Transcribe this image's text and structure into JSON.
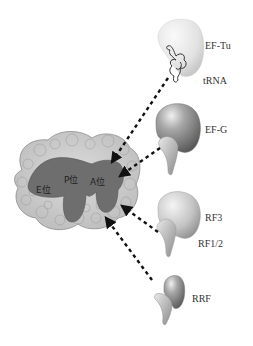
{
  "diagram": {
    "type": "ribosome-translation-factors",
    "ribosome": {
      "name": "ribosome",
      "sites": [
        {
          "id": "E",
          "label": "E位"
        },
        {
          "id": "P",
          "label": "P位"
        },
        {
          "id": "A",
          "label": "A位"
        }
      ]
    },
    "factors": [
      {
        "id": "ef-tu",
        "label": "EF-Tu",
        "sub_label": "tRNA"
      },
      {
        "id": "ef-g",
        "label": "EF-G"
      },
      {
        "id": "rf3",
        "label": "RF3"
      },
      {
        "id": "rf12",
        "label": "RF1/2"
      },
      {
        "id": "rrf",
        "label": "RRF"
      }
    ],
    "arrows": [
      {
        "from": "EF-Tu",
        "to": "ribosome",
        "style": "dashed"
      },
      {
        "from": "EF-G",
        "to": "ribosome",
        "style": "dashed"
      },
      {
        "from": "RF3",
        "to": "ribosome",
        "style": "dashed"
      },
      {
        "from": "RF1/2",
        "to": "ribosome",
        "style": "dashed"
      },
      {
        "from": "RRF",
        "to": "ribosome",
        "style": "dashed"
      }
    ],
    "colors": {
      "ribosome_body": "#d4d4d4",
      "ribosome_cavity": "#6e6e6e",
      "factor_light": "#e6e6e6",
      "factor_dark": "#7a7a7a",
      "arrow": "#111111"
    }
  }
}
